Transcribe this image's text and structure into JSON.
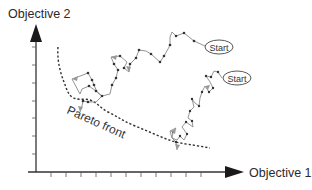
{
  "diagram": {
    "y_axis_label": "Objective 2",
    "x_axis_label": "Objective 1",
    "pareto_label": "Pareto front",
    "start_labels": [
      "Start",
      "Start"
    ],
    "colors": {
      "axis": "#333333",
      "arrowhead": "#1a1a1a",
      "pareto": "#333333",
      "trajectory": "#888888",
      "node": "#333333",
      "text": "#2a2a2a"
    },
    "y_ticks": 8,
    "x_ticks": 10
  }
}
